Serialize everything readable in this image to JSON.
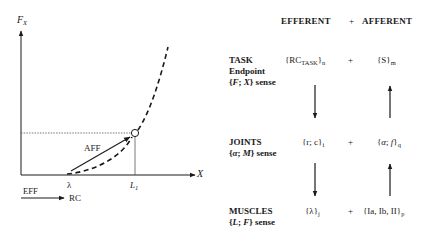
{
  "graph": {
    "y_axis_label": "F",
    "y_axis_sub": "X",
    "x_axis_label": "X",
    "lambda_label": "λ",
    "l1_label": "L",
    "l1_sub": "1",
    "aff_label": "AFF",
    "eff_label": "EFF",
    "rc_label": "RC"
  },
  "table": {
    "header_efferent": "EFFERENT",
    "header_plus": "+",
    "header_afferent": "AFFERENT",
    "rows": [
      {
        "title": "TASK",
        "subtitle": "Endpoint",
        "sense_open": "{",
        "sense_a": "F",
        "sense_sep": "; ",
        "sense_b": "X",
        "sense_close": "} sense",
        "eff_main": "{RC",
        "eff_sub_inner": "TASK",
        "eff_close": "}",
        "eff_sub": "n",
        "plus": "+",
        "aff_main": "{S}",
        "aff_sub": "m"
      },
      {
        "title": "JOINTS",
        "sense_open": "{",
        "sense_a": "α",
        "sense_sep": "; ",
        "sense_b": "M",
        "sense_close": "} sense",
        "eff_main": "{r; c}",
        "eff_sub": "i",
        "plus": "+",
        "aff_open": "{",
        "aff_a": "α",
        "aff_sep": "; ",
        "aff_b": "f",
        "aff_close": "}",
        "aff_sub": "q"
      },
      {
        "title": "MUSCLES",
        "sense_open": "{",
        "sense_a": "L",
        "sense_sep": "; ",
        "sense_b": "F",
        "sense_close": "} sense",
        "eff_main": "{λ}",
        "eff_sub": "j",
        "plus": "+",
        "aff_main": "{Ia, Ib, II}",
        "aff_sub": "p"
      }
    ]
  }
}
